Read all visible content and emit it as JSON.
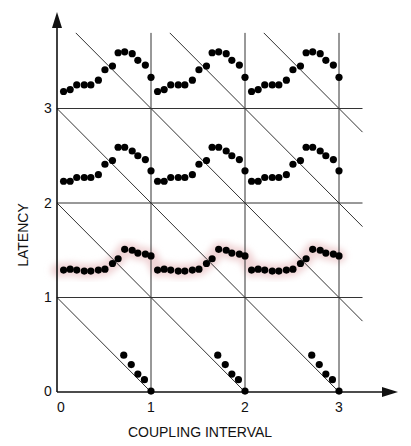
{
  "chart_data": {
    "type": "scatter",
    "title": "",
    "xlabel": "COUPLING INTERVAL",
    "ylabel": "LATENCY",
    "xlim": [
      0,
      3.25
    ],
    "ylim": [
      0,
      3.8
    ],
    "x_ticks": [
      "0",
      "1",
      "2",
      "3"
    ],
    "y_ticks": [
      "0",
      "1",
      "2",
      "3"
    ],
    "grid": true,
    "diagonal_lines": "x + y = c for c = 1..6",
    "highlight_color": "#f0d4d6",
    "point_color": "#000000",
    "series": [
      {
        "name": "band-3",
        "period_x": [
          0.07,
          0.14,
          0.21,
          0.29,
          0.36,
          0.44,
          0.51,
          0.59,
          0.65,
          0.72,
          0.8,
          0.86,
          0.94,
          1.0
        ],
        "period_y": [
          3.18,
          3.2,
          3.25,
          3.25,
          3.25,
          3.3,
          3.41,
          3.45,
          3.59,
          3.6,
          3.58,
          3.51,
          3.46,
          3.33
        ],
        "repeats": 3
      },
      {
        "name": "band-2",
        "period_x": [
          0.07,
          0.14,
          0.21,
          0.29,
          0.36,
          0.44,
          0.51,
          0.59,
          0.65,
          0.72,
          0.8,
          0.86,
          0.94,
          1.0
        ],
        "period_y": [
          2.23,
          2.23,
          2.27,
          2.27,
          2.27,
          2.3,
          2.41,
          2.45,
          2.59,
          2.59,
          2.55,
          2.5,
          2.46,
          2.34
        ],
        "repeats": 3
      },
      {
        "name": "band-1-highlighted",
        "period_x": [
          0.07,
          0.14,
          0.21,
          0.29,
          0.36,
          0.44,
          0.51,
          0.59,
          0.65,
          0.72,
          0.8,
          0.86,
          0.94,
          1.0
        ],
        "period_y": [
          1.29,
          1.3,
          1.29,
          1.28,
          1.28,
          1.29,
          1.3,
          1.36,
          1.41,
          1.51,
          1.5,
          1.47,
          1.46,
          1.44,
          1.36
        ],
        "repeats": 3,
        "highlighted": true
      },
      {
        "name": "band-0",
        "period_x": [
          0.71,
          0.79,
          0.86,
          0.93,
          1.0
        ],
        "period_y": [
          0.39,
          0.29,
          0.19,
          0.13,
          0.01
        ],
        "repeats": 3
      }
    ]
  }
}
